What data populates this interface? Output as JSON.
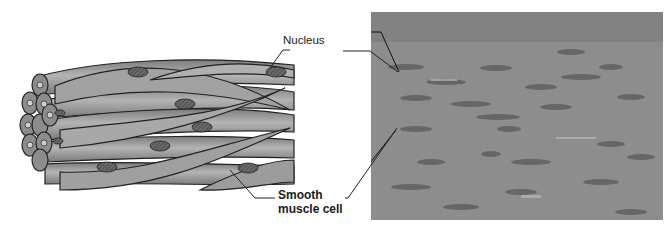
{
  "figure": {
    "labels": {
      "nucleus": "Nucleus",
      "smooth_muscle_cell_line1": "Smooth",
      "smooth_muscle_cell_line2": "muscle cell"
    },
    "panels": [
      {
        "name": "illustration",
        "description": "Drawing of bundle of spindle-shaped smooth muscle cells with oval nuclei"
      },
      {
        "name": "micrograph",
        "description": "Light micrograph of smooth muscle tissue"
      }
    ],
    "colors": {
      "cell_fill": "#9a9a9a",
      "cell_outline": "#222222",
      "photo_bg": "#8a8a8a",
      "nucleus_fill": "#5a5a5a"
    }
  }
}
